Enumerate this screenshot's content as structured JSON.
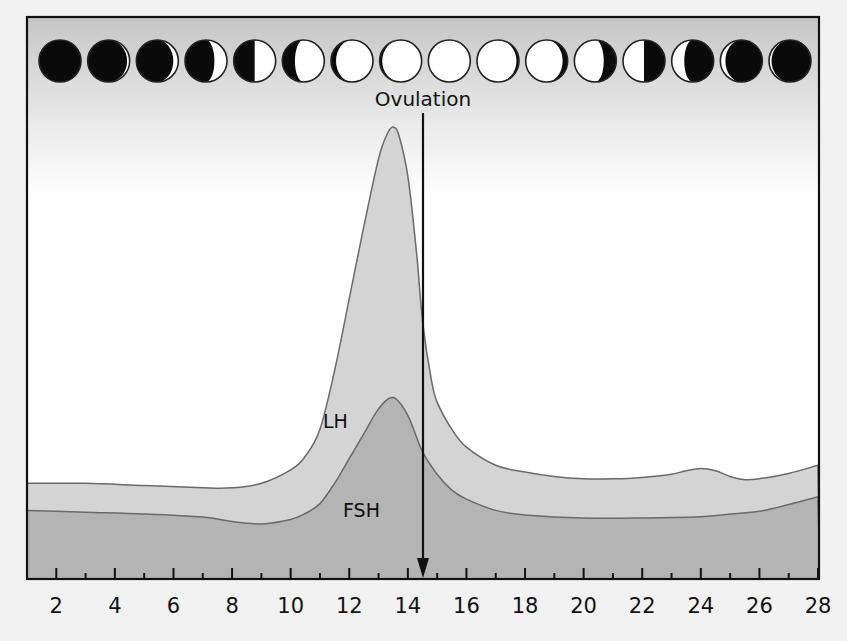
{
  "chart_data": {
    "type": "area",
    "title": "",
    "xlabel": "",
    "ylabel": "",
    "xlim": [
      1,
      28
    ],
    "ylim": [
      0,
      100
    ],
    "grid": false,
    "legend": "inline labels",
    "x_ticks_major": [
      2,
      4,
      6,
      8,
      10,
      12,
      14,
      16,
      18,
      20,
      22,
      24,
      26,
      28
    ],
    "x_ticks_minor": [
      3,
      5,
      7,
      9,
      11,
      13,
      15,
      17,
      19,
      21,
      23,
      25,
      27
    ],
    "tick_labels": [
      "2",
      "4",
      "6",
      "8",
      "10",
      "12",
      "14",
      "16",
      "18",
      "20",
      "22",
      "24",
      "26",
      "28"
    ],
    "series": [
      {
        "name": "LH",
        "label": "LH",
        "fill": "#d4d4d4",
        "x": [
          1,
          3,
          5,
          7,
          8,
          9,
          10,
          10.5,
          11,
          11.5,
          12,
          12.5,
          13,
          13.3,
          13.5,
          13.7,
          14,
          14.3,
          14.5,
          14.8,
          15,
          15.5,
          16,
          17,
          18,
          19,
          20,
          21,
          22,
          23,
          23.5,
          24,
          24.5,
          25,
          25.5,
          26,
          27,
          28
        ],
        "values": [
          21,
          21,
          20.5,
          20,
          20,
          21,
          24,
          27,
          33,
          46,
          62,
          78,
          93,
          98.5,
          100,
          98,
          89,
          72,
          57,
          44,
          39,
          33,
          29,
          25,
          23.5,
          22.5,
          22,
          22,
          22.3,
          23,
          23.8,
          24.3,
          23.8,
          22.5,
          21.8,
          22,
          23.2,
          25
        ]
      },
      {
        "name": "FSH",
        "label": "FSH",
        "fill": "#b4b4b4",
        "x": [
          1,
          3,
          5,
          7,
          8,
          9,
          10,
          10.5,
          11,
          11.5,
          12,
          12.5,
          13,
          13.5,
          14,
          14.5,
          15,
          15.5,
          16,
          17,
          18,
          20,
          22,
          24,
          25,
          26,
          27,
          28
        ],
        "values": [
          15,
          14.6,
          14.2,
          13.5,
          12.5,
          12,
          13,
          14.3,
          16.5,
          21,
          26.5,
          32,
          37.5,
          40,
          36,
          28,
          23,
          19.5,
          17.5,
          15,
          14,
          13.3,
          13.3,
          13.6,
          14.2,
          14.8,
          16.3,
          18
        ]
      }
    ],
    "annotations": [
      {
        "text": "Ovulation",
        "x": 14.5,
        "type": "downward-arrow"
      }
    ],
    "moon_phases": {
      "count": 16,
      "sequence": [
        {
          "phase": "new",
          "lit": 0,
          "side": "right"
        },
        {
          "phase": "waxing-crescent",
          "lit": 0.06,
          "side": "right"
        },
        {
          "phase": "waxing-crescent",
          "lit": 0.12,
          "side": "right"
        },
        {
          "phase": "waxing-crescent",
          "lit": 0.3,
          "side": "right"
        },
        {
          "phase": "first-quarter",
          "lit": 0.5,
          "side": "right"
        },
        {
          "phase": "waxing-gibbous",
          "lit": 0.7,
          "side": "right"
        },
        {
          "phase": "waxing-gibbous",
          "lit": 0.88,
          "side": "right"
        },
        {
          "phase": "waxing-gibbous",
          "lit": 0.94,
          "side": "right"
        },
        {
          "phase": "full",
          "lit": 1,
          "side": "right"
        },
        {
          "phase": "waning-gibbous",
          "lit": 0.94,
          "side": "left"
        },
        {
          "phase": "waning-gibbous",
          "lit": 0.88,
          "side": "left"
        },
        {
          "phase": "waning-gibbous",
          "lit": 0.7,
          "side": "left"
        },
        {
          "phase": "last-quarter",
          "lit": 0.5,
          "side": "left"
        },
        {
          "phase": "waning-crescent",
          "lit": 0.3,
          "side": "left"
        },
        {
          "phase": "waning-crescent",
          "lit": 0.12,
          "side": "left"
        },
        {
          "phase": "waning-crescent",
          "lit": 0.06,
          "side": "left"
        }
      ]
    }
  },
  "labels": {
    "ovulation": "Ovulation",
    "lh": "LH",
    "fsh": "FSH"
  },
  "colors": {
    "page_background": "#f2f2f2",
    "frame_top": "#c6c6c6",
    "frame_bottom": "#ffffff",
    "lh_fill": "#d4d4d4",
    "fsh_fill": "#b4b4b4",
    "curve_stroke": "#6a6a6a",
    "ink": "#111111",
    "moon_light": "#ffffff",
    "moon_dark": "#0a0a0a"
  }
}
